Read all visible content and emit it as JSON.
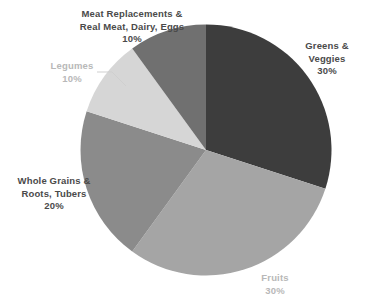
{
  "chart_data": {
    "type": "pie",
    "title": "",
    "xlabel": "",
    "ylabel": "",
    "legend_position": "none",
    "grid": false,
    "labels_outside": true,
    "categories": [
      "Greens & Veggies",
      "Fruits",
      "Whole Grains & Roots, Tubers",
      "Legumes",
      "Meat Replacements & Real Meat, Dairy, Eggs"
    ],
    "values": [
      30,
      30,
      20,
      10,
      10
    ],
    "value_labels": [
      "30%",
      "30%",
      "20%",
      "10%",
      "10%"
    ],
    "colors": [
      "#3d3d3d",
      "#a5a5a5",
      "#8b8b8b",
      "#d6d6d6",
      "#707070"
    ],
    "slices": [
      {
        "name": "Greens & Veggies",
        "value": 30,
        "value_label": "30%",
        "color": "#3d3d3d",
        "start_angle_deg": 0,
        "end_angle_deg": 108
      },
      {
        "name": "Fruits",
        "value": 30,
        "value_label": "30%",
        "color": "#a5a5a5",
        "start_angle_deg": 108,
        "end_angle_deg": 216
      },
      {
        "name": "Whole Grains & Roots, Tubers",
        "value": 20,
        "value_label": "20%",
        "color": "#8b8b8b",
        "start_angle_deg": 216,
        "end_angle_deg": 288
      },
      {
        "name": "Legumes",
        "value": 10,
        "value_label": "10%",
        "color": "#d6d6d6",
        "start_angle_deg": 288,
        "end_angle_deg": 324
      },
      {
        "name": "Meat Replacements & Real Meat, Dairy, Eggs",
        "value": 10,
        "value_label": "10%",
        "color": "#707070",
        "start_angle_deg": 324,
        "end_angle_deg": 360
      }
    ]
  },
  "labels": {
    "meat": {
      "line1": "Meat Replacements &",
      "line2": "Real Meat, Dairy, Eggs",
      "value": "10%"
    },
    "greens": {
      "line1": "Greens &",
      "line2": "Veggies",
      "value": "30%"
    },
    "legumes": {
      "line1": "Legumes",
      "value": "10%"
    },
    "grains": {
      "line1": "Whole Grains &",
      "line2": "Roots, Tubers",
      "value": "20%"
    },
    "fruits": {
      "line1": "Fruits",
      "value": "30%"
    }
  },
  "colors": {
    "background": "#ffffff",
    "label_dark": "#4a4a4a",
    "label_light": "#b8b8b8",
    "leader_line": "#cccccc"
  }
}
